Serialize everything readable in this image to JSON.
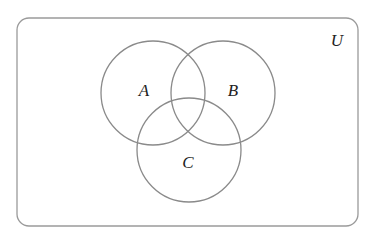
{
  "diagram": {
    "type": "venn",
    "universe": {
      "label": "U",
      "x": 17,
      "y": 18,
      "width": 341,
      "height": 208,
      "radius": 12,
      "label_x": 337,
      "label_y": 46
    },
    "sets": [
      {
        "label": "A",
        "cx": 153,
        "cy": 93,
        "r": 52,
        "label_x": 144,
        "label_y": 96
      },
      {
        "label": "B",
        "cx": 223,
        "cy": 93,
        "r": 52,
        "label_x": 233,
        "label_y": 96
      },
      {
        "label": "C",
        "cx": 189,
        "cy": 150,
        "r": 52,
        "label_x": 188,
        "label_y": 168
      }
    ],
    "stroke_color": "#8a8a8a",
    "universe_stroke_color": "#9a9a9a",
    "label_color": "#222222"
  }
}
